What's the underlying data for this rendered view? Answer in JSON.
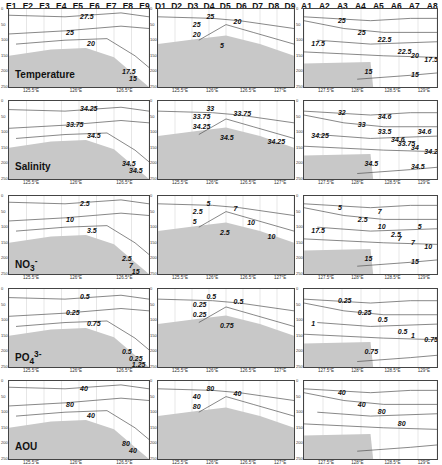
{
  "chart_data": {
    "type": "contour-section-panels",
    "layout": {
      "rows": 5,
      "cols": 3
    },
    "columns": [
      {
        "transect": "E",
        "stations": [
          "E1",
          "E2",
          "E3",
          "E4",
          "E5",
          "E6",
          "E7",
          "E8",
          "E9"
        ],
        "x_ticks": [
          "125.5°E",
          "126°E",
          "126.5°E"
        ]
      },
      {
        "transect": "D",
        "stations": [
          "D1",
          "D2",
          "D3",
          "D4",
          "D5",
          "D6",
          "D7",
          "D8",
          "D9"
        ],
        "x_ticks": [
          "125.5°E",
          "126°E",
          "126.5°E",
          "127°E"
        ]
      },
      {
        "transect": "A",
        "stations": [
          "A1",
          "A2",
          "A3",
          "A4",
          "A5",
          "A6",
          "A7",
          "A8"
        ],
        "x_ticks": [
          "127.5°E",
          "128°E",
          "128.5°E",
          "129°E"
        ]
      }
    ],
    "y_ticks": [
      "0",
      "50",
      "100",
      "150",
      "200",
      "250"
    ],
    "ylabel": "Depth (m)",
    "rows": [
      {
        "variable": "Temperature",
        "label": "Temperature",
        "contours": [
          [
            "27.5",
            "25",
            "20",
            "17.5",
            "15"
          ],
          [
            "25",
            "25",
            "20",
            "20",
            "5"
          ],
          [
            "25",
            "25",
            "22.5",
            "22.5",
            "20",
            "17.5",
            "17.5",
            "15",
            "15"
          ]
        ]
      },
      {
        "variable": "Salinity",
        "label": "Salinity",
        "contours": [
          [
            "34.25",
            "33.75",
            "34.5",
            "34.5",
            "34.5"
          ],
          [
            "33",
            "33.75",
            "33.75",
            "34.25",
            "34.5",
            "34.25"
          ],
          [
            "32",
            "33",
            "33.5",
            "33.75",
            "34",
            "34.25",
            "34.25",
            "34.5",
            "34.5",
            "34.6",
            "34.6",
            "34.6"
          ]
        ]
      },
      {
        "variable": "NO3-",
        "label": "NO3",
        "contours": [
          [
            "2.5",
            "10",
            "3.5",
            "2.5",
            "7",
            "15"
          ],
          [
            "5",
            "2.5",
            "7",
            "5",
            "2.5",
            "10",
            "10"
          ],
          [
            "5",
            "2.5",
            "10",
            "7",
            "7",
            "10",
            "17.5",
            "15",
            "15",
            "2.5",
            "5",
            "7"
          ]
        ]
      },
      {
        "variable": "PO43-",
        "label": "PO4",
        "contours": [
          [
            "0.5",
            "0.25",
            "0.75",
            "0.5",
            "0.25",
            "1.25"
          ],
          [
            "0.5",
            "0.25",
            "0.5",
            "0.25",
            "0.75"
          ],
          [
            "0.25",
            "0.25",
            "0.5",
            "0.5",
            "1",
            "0.75",
            "1",
            "0.75"
          ]
        ]
      },
      {
        "variable": "AOU",
        "label": "AOU",
        "contours": [
          [
            "40",
            "80",
            "40",
            "80",
            "40"
          ],
          [
            "80",
            "40",
            "40",
            "80"
          ],
          [
            "40",
            "40",
            "80",
            "80"
          ]
        ]
      }
    ]
  },
  "labels": {
    "E": [
      "E1",
      "E2",
      "E3",
      "E4",
      "E5",
      "E6",
      "E7",
      "E8",
      "E9"
    ],
    "D": [
      "D1",
      "D2",
      "D3",
      "D4",
      "D5",
      "D6",
      "D7",
      "D8",
      "D9"
    ],
    "A": [
      "A1",
      "A2",
      "A3",
      "A4",
      "A5",
      "A6",
      "A7",
      "A8"
    ],
    "rows": [
      "Temperature",
      "Salinity",
      "NO",
      "PO",
      "AOU"
    ],
    "sub_no3": "3",
    "sup_no3": "-",
    "sub_po4": "4",
    "sup_po4": "3-"
  }
}
